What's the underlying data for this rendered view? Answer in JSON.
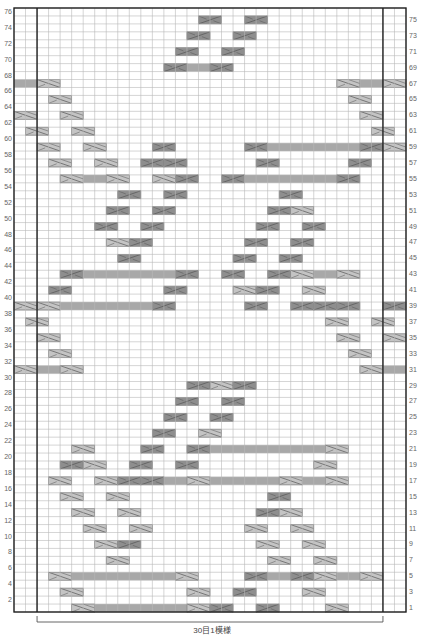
{
  "chart": {
    "title": "",
    "caption": "30目1模様",
    "total_rows": 76,
    "total_cols": 34,
    "repeat_cols": 30,
    "edge_cols_each_side": 2,
    "colors": {
      "grid_line": "#b8b8b8",
      "border": "#222222",
      "band": "#a8a8a8",
      "cable_light": "#c4c4c4",
      "cable_dark": "#8e8e8e",
      "cable_line": "#555555",
      "label": "#666666"
    },
    "row_labels_left": [
      76,
      74,
      72,
      70,
      68,
      66,
      64,
      62,
      60,
      58,
      56,
      54,
      52,
      50,
      48,
      46,
      44,
      42,
      40,
      38,
      36,
      34,
      32,
      30,
      28,
      26,
      24,
      22,
      20,
      18,
      16,
      14,
      12,
      10,
      8,
      6,
      4,
      2
    ],
    "row_labels_right": [
      75,
      73,
      71,
      69,
      67,
      65,
      63,
      61,
      59,
      57,
      55,
      53,
      51,
      49,
      47,
      45,
      43,
      41,
      39,
      37,
      35,
      33,
      31,
      29,
      27,
      25,
      23,
      21,
      19,
      17,
      15,
      13,
      11,
      9,
      7,
      5,
      3,
      1
    ]
  },
  "chart_data": {
    "type": "table",
    "xlabel": "30目1模様",
    "ylabel": "rows",
    "rows": 76,
    "cols": 34,
    "legend": [
      "cable_light = right cross (2 sts)",
      "cable_dark = left cross (2 sts)",
      "band = purl/shaded stitches"
    ],
    "cells": [
      {
        "row": 75,
        "items": [
          [
            "d",
            16
          ],
          [
            "d",
            20
          ]
        ]
      },
      {
        "row": 73,
        "items": [
          [
            "d",
            15
          ],
          [
            "d",
            19
          ]
        ]
      },
      {
        "row": 71,
        "items": [
          [
            "d",
            14
          ],
          [
            "d",
            18
          ]
        ]
      },
      {
        "row": 69,
        "items": [
          [
            "d",
            13
          ],
          [
            "b",
            15,
            16
          ],
          [
            "d",
            17
          ]
        ]
      },
      {
        "row": 67,
        "items": [
          [
            "b",
            0,
            1
          ],
          [
            "l",
            2
          ],
          [
            "l",
            28
          ],
          [
            "b",
            30,
            31
          ],
          [
            "l",
            32
          ]
        ]
      },
      {
        "row": 65,
        "items": [
          [
            "l",
            3
          ],
          [
            "l",
            29
          ]
        ]
      },
      {
        "row": 63,
        "items": [
          [
            "l",
            0
          ],
          [
            "l",
            4
          ],
          [
            "l",
            30
          ]
        ]
      },
      {
        "row": 61,
        "items": [
          [
            "l",
            1
          ],
          [
            "l",
            5
          ],
          [
            "l",
            31
          ]
        ]
      },
      {
        "row": 59,
        "items": [
          [
            "l",
            2
          ],
          [
            "l",
            6
          ],
          [
            "d",
            12
          ],
          [
            "d",
            20
          ],
          [
            "b",
            22,
            29
          ],
          [
            "d",
            30
          ],
          [
            "l",
            32
          ]
        ]
      },
      {
        "row": 57,
        "items": [
          [
            "l",
            3
          ],
          [
            "l",
            7
          ],
          [
            "d",
            11
          ],
          [
            "d",
            13
          ],
          [
            "d",
            21
          ],
          [
            "d",
            29
          ]
        ]
      },
      {
        "row": 55,
        "items": [
          [
            "l",
            4
          ],
          [
            "b",
            6,
            7
          ],
          [
            "l",
            8
          ],
          [
            "l",
            12
          ],
          [
            "d",
            14
          ],
          [
            "d",
            18
          ],
          [
            "b",
            20,
            27
          ],
          [
            "d",
            28
          ]
        ]
      },
      {
        "row": 53,
        "items": [
          [
            "d",
            9
          ],
          [
            "d",
            13
          ],
          [
            "d",
            23
          ]
        ]
      },
      {
        "row": 51,
        "items": [
          [
            "d",
            8
          ],
          [
            "d",
            12
          ],
          [
            "d",
            22
          ],
          [
            "l",
            24
          ]
        ]
      },
      {
        "row": 49,
        "items": [
          [
            "d",
            7
          ],
          [
            "d",
            11
          ],
          [
            "d",
            21
          ],
          [
            "d",
            25
          ]
        ]
      },
      {
        "row": 47,
        "items": [
          [
            "l",
            8
          ],
          [
            "d",
            10
          ],
          [
            "d",
            20
          ],
          [
            "d",
            24
          ]
        ]
      },
      {
        "row": 45,
        "items": [
          [
            "d",
            9
          ],
          [
            "d",
            19
          ],
          [
            "d",
            23
          ]
        ]
      },
      {
        "row": 43,
        "items": [
          [
            "d",
            4
          ],
          [
            "b",
            6,
            13
          ],
          [
            "d",
            14
          ],
          [
            "d",
            18
          ],
          [
            "d",
            22
          ],
          [
            "l",
            24
          ],
          [
            "b",
            26,
            27
          ],
          [
            "l",
            28
          ]
        ]
      },
      {
        "row": 41,
        "items": [
          [
            "d",
            3
          ],
          [
            "d",
            13
          ],
          [
            "l",
            19
          ],
          [
            "d",
            21
          ],
          [
            "l",
            25
          ]
        ]
      },
      {
        "row": 39,
        "items": [
          [
            "l",
            0
          ],
          [
            "l",
            2
          ],
          [
            "b",
            4,
            11
          ],
          [
            "d",
            12
          ],
          [
            "d",
            20
          ],
          [
            "d",
            24
          ],
          [
            "d",
            26
          ],
          [
            "d",
            28
          ],
          [
            "d",
            32
          ]
        ]
      },
      {
        "row": 37,
        "items": [
          [
            "l",
            1
          ],
          [
            "l",
            27
          ],
          [
            "l",
            31
          ]
        ]
      },
      {
        "row": 35,
        "items": [
          [
            "l",
            2
          ],
          [
            "l",
            28
          ],
          [
            "l",
            32
          ]
        ]
      },
      {
        "row": 33,
        "items": [
          [
            "l",
            3
          ],
          [
            "l",
            29
          ]
        ]
      },
      {
        "row": 31,
        "items": [
          [
            "l",
            0
          ],
          [
            "b",
            2,
            3
          ],
          [
            "l",
            4
          ],
          [
            "l",
            30
          ],
          [
            "b",
            32,
            33
          ]
        ]
      },
      {
        "row": 29,
        "items": [
          [
            "d",
            15
          ],
          [
            "l",
            17
          ],
          [
            "d",
            19
          ]
        ]
      },
      {
        "row": 27,
        "items": [
          [
            "d",
            14
          ],
          [
            "d",
            18
          ]
        ]
      },
      {
        "row": 25,
        "items": [
          [
            "d",
            13
          ],
          [
            "d",
            17
          ]
        ]
      },
      {
        "row": 23,
        "items": [
          [
            "d",
            12
          ],
          [
            "l",
            16
          ]
        ]
      },
      {
        "row": 21,
        "items": [
          [
            "l",
            5
          ],
          [
            "d",
            11
          ],
          [
            "d",
            15
          ],
          [
            "b",
            17,
            26
          ],
          [
            "l",
            27
          ]
        ]
      },
      {
        "row": 19,
        "items": [
          [
            "d",
            4
          ],
          [
            "l",
            6
          ],
          [
            "d",
            10
          ],
          [
            "d",
            14
          ],
          [
            "l",
            26
          ]
        ]
      },
      {
        "row": 17,
        "items": [
          [
            "l",
            3
          ],
          [
            "l",
            7
          ],
          [
            "d",
            9
          ],
          [
            "d",
            11
          ],
          [
            "b",
            13,
            14
          ],
          [
            "l",
            15
          ],
          [
            "b",
            17,
            22
          ],
          [
            "l",
            23
          ],
          [
            "b",
            25,
            26
          ],
          [
            "l",
            27
          ]
        ]
      },
      {
        "row": 15,
        "items": [
          [
            "l",
            4
          ],
          [
            "l",
            8
          ],
          [
            "d",
            22
          ]
        ]
      },
      {
        "row": 13,
        "items": [
          [
            "l",
            5
          ],
          [
            "l",
            9
          ],
          [
            "d",
            21
          ],
          [
            "l",
            23
          ]
        ]
      },
      {
        "row": 11,
        "items": [
          [
            "l",
            6
          ],
          [
            "l",
            10
          ],
          [
            "l",
            20
          ],
          [
            "l",
            24
          ]
        ]
      },
      {
        "row": 9,
        "items": [
          [
            "l",
            7
          ],
          [
            "d",
            9
          ],
          [
            "l",
            21
          ],
          [
            "l",
            25
          ]
        ]
      },
      {
        "row": 7,
        "items": [
          [
            "l",
            8
          ],
          [
            "l",
            22
          ],
          [
            "l",
            26
          ]
        ]
      },
      {
        "row": 5,
        "items": [
          [
            "l",
            3
          ],
          [
            "b",
            5,
            13
          ],
          [
            "l",
            14
          ],
          [
            "d",
            20
          ],
          [
            "b",
            22,
            23
          ],
          [
            "d",
            24
          ],
          [
            "l",
            26
          ],
          [
            "b",
            28,
            29
          ],
          [
            "l",
            30
          ]
        ]
      },
      {
        "row": 3,
        "items": [
          [
            "l",
            4
          ],
          [
            "l",
            15
          ],
          [
            "d",
            19
          ],
          [
            "l",
            25
          ]
        ]
      },
      {
        "row": 1,
        "items": [
          [
            "l",
            5
          ],
          [
            "b",
            7,
            14
          ],
          [
            "l",
            15
          ],
          [
            "d",
            17
          ],
          [
            "d",
            21
          ],
          [
            "l",
            27
          ]
        ]
      }
    ]
  }
}
